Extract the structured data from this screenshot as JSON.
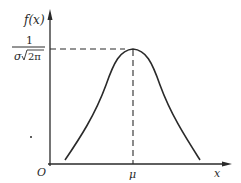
{
  "diagram": {
    "y_axis_label": "f(x)",
    "x_axis_label": "x",
    "origin_label": "O",
    "peak_x_label": "μ",
    "peak_value_numerator": "1",
    "peak_value_denominator_sigma": "σ",
    "peak_value_denominator_sqrt": "2π",
    "colors": {
      "ink": "#2a2a2a",
      "background": "#ffffff"
    }
  }
}
